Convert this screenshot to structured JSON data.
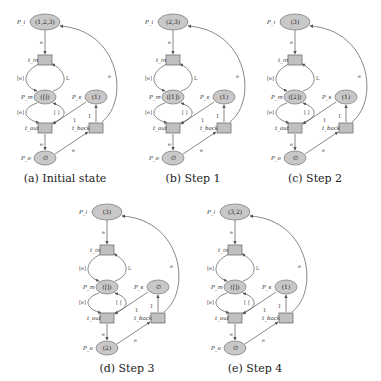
{
  "figure": {
    "panels": [
      {
        "id": "a",
        "caption": "(a) Initial state",
        "tokens": {
          "P_i": "(1,2,3)",
          "P_m": "([])",
          "P_s": "(1)",
          "P_o": "∅"
        }
      },
      {
        "id": "b",
        "caption": "(b) Step 1",
        "tokens": {
          "P_i": "(2,3)",
          "P_m": "([1])",
          "P_s": "(1)",
          "P_o": "∅"
        }
      },
      {
        "id": "c",
        "caption": "(c) Step 2",
        "tokens": {
          "P_i": "(3)",
          "P_m": "([2])",
          "P_s": "(1)",
          "P_o": "∅"
        }
      },
      {
        "id": "d",
        "caption": "(d) Step 3",
        "tokens": {
          "P_i": "(3)",
          "P_m": "([])",
          "P_s": "∅",
          "P_o": "(2)"
        }
      },
      {
        "id": "e",
        "caption": "(e) Step 4",
        "tokens": {
          "P_i": "(3,2)",
          "P_m": "([])",
          "P_s": "(1)",
          "P_o": "∅"
        }
      }
    ],
    "labels": {
      "place_in": "P_i",
      "place_mid": "P_m",
      "place_s": "P_s",
      "place_out": "P_o",
      "trans_in": "t_in",
      "trans_out": "t_out",
      "trans_back": "t_back",
      "arc_e": "e",
      "arc_list_e": "[e]",
      "arc_L": "L",
      "arc_empty": "[ ]",
      "arc_one": "1"
    }
  }
}
